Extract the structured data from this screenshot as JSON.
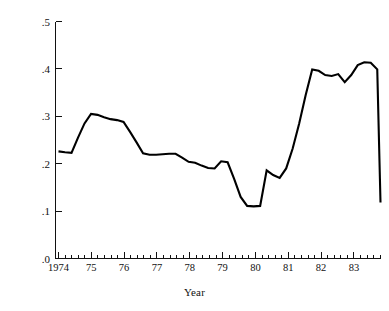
{
  "chart_data": {
    "type": "line",
    "title": "",
    "xlabel": "Year",
    "ylabel": "Time varying coefficient",
    "xlim": [
      1974.0,
      1983.9
    ],
    "ylim": [
      0.0,
      0.5
    ],
    "grid": false,
    "legend": null,
    "line_color": "#000000",
    "background_color": "#ffffff",
    "x_tick_labels": [
      "1974",
      "75",
      "76",
      "77",
      "78",
      "79",
      "80",
      "81",
      "82",
      "83"
    ],
    "x_tick_values": [
      1974,
      1975,
      1976,
      1977,
      1978,
      1979,
      1980,
      1981,
      1982,
      1983
    ],
    "x_minor_ticks_per_interval": 4,
    "y_tick_labels": [
      ".0",
      ".1",
      ".2",
      ".3",
      ".4",
      ".5"
    ],
    "y_tick_values": [
      0.0,
      0.1,
      0.2,
      0.3,
      0.4,
      0.5
    ],
    "series": [
      {
        "name": "Time varying coefficient",
        "x": [
          1974.0,
          1974.2,
          1974.4,
          1974.6,
          1974.8,
          1975.0,
          1975.2,
          1975.4,
          1975.6,
          1975.8,
          1976.0,
          1976.2,
          1976.4,
          1976.6,
          1976.8,
          1977.0,
          1977.2,
          1977.4,
          1977.6,
          1977.8,
          1978.0,
          1978.2,
          1978.4,
          1978.6,
          1978.8,
          1979.0,
          1979.2,
          1979.4,
          1979.6,
          1979.8,
          1980.0,
          1980.2,
          1980.4,
          1980.6,
          1980.8,
          1981.0,
          1981.2,
          1981.4,
          1981.6,
          1981.8,
          1982.0,
          1982.2,
          1982.4,
          1982.6,
          1982.8,
          1983.0,
          1983.2,
          1983.4,
          1983.6,
          1983.8
        ],
        "y": [
          0.226,
          0.224,
          0.223,
          0.255,
          0.285,
          0.305,
          0.303,
          0.298,
          0.294,
          0.292,
          0.288,
          0.267,
          0.245,
          0.222,
          0.219,
          0.219,
          0.22,
          0.221,
          0.221,
          0.213,
          0.204,
          0.202,
          0.196,
          0.191,
          0.19,
          0.205,
          0.203,
          0.168,
          0.13,
          0.111,
          0.11,
          0.111,
          0.186,
          0.176,
          0.17,
          0.19,
          0.232,
          0.285,
          0.345,
          0.399,
          0.396,
          0.387,
          0.385,
          0.389,
          0.372,
          0.387,
          0.408,
          0.414,
          0.413,
          0.399
        ]
      }
    ],
    "series_extra": {
      "note": "continuation of single series to right edge",
      "x": [
        1982.4,
        1982.55,
        1982.7,
        1982.85,
        1983.0,
        1983.2,
        1983.45,
        1983.7,
        1983.9
      ],
      "y": [
        0.34,
        0.372,
        0.4,
        0.414,
        0.413,
        0.3,
        0.133,
        0.118,
        0.118
      ]
    }
  }
}
